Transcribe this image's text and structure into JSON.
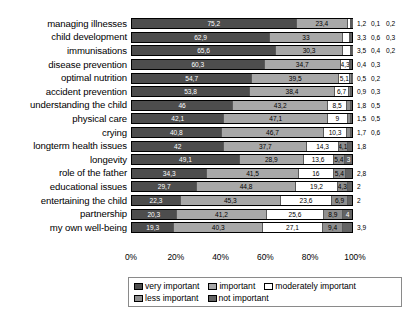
{
  "chart_data": {
    "type": "bar",
    "subtype": "horizontal-stacked-100",
    "title": "",
    "xlabel": "",
    "ylabel": "",
    "xlim": [
      0,
      100
    ],
    "xticks": [
      "0%",
      "20%",
      "40%",
      "60%",
      "80%",
      "100%"
    ],
    "grid": false,
    "legend_position": "bottom",
    "series": [
      {
        "name": "very important",
        "color": "#4d4d4d"
      },
      {
        "name": "important",
        "color": "#a8a8a8"
      },
      {
        "name": "moderately important",
        "color": "#ffffff"
      },
      {
        "name": "less important",
        "color": "#8f8f8f"
      },
      {
        "name": "not important",
        "color": "#636363"
      }
    ],
    "categories": [
      "managing illnesses",
      "child development",
      "immunisations",
      "disease prevention",
      "optimal nutrition",
      "accident prevention",
      "understanding the child",
      "physical care",
      "crying",
      "longterm health issues",
      "longevity",
      "role of the father",
      "educational issues",
      "entertaining the child",
      "partnership",
      "my own well-being"
    ],
    "rows": [
      {
        "category": "managing illnesses",
        "values": [
          75.2,
          23.4,
          1.2,
          0.1,
          0.2
        ],
        "labels": [
          "75,2",
          "23,4",
          "1,2",
          "0,1",
          "0,2"
        ],
        "inside": 2,
        "trailing": [
          "1,2",
          "0,1",
          "0,2"
        ]
      },
      {
        "category": "child development",
        "values": [
          62.9,
          33.0,
          3.3,
          0.6,
          0.3
        ],
        "labels": [
          "62,9",
          "33",
          "3,3",
          "0,6",
          "0,3"
        ],
        "inside": 2,
        "trailing": [
          "3,3",
          "0,6",
          "0,3"
        ]
      },
      {
        "category": "immunisations",
        "values": [
          65.6,
          30.3,
          3.5,
          0.4,
          0.2
        ],
        "labels": [
          "65,6",
          "30,3",
          "3,5",
          "0,4",
          "0,2"
        ],
        "inside": 2,
        "trailing": [
          "3,5",
          "0,4",
          "0,2"
        ]
      },
      {
        "category": "disease prevention",
        "values": [
          60.3,
          34.7,
          4.3,
          0.4,
          0.3
        ],
        "labels": [
          "60,3",
          "34,7",
          "4,3",
          "0,4",
          "0,3"
        ],
        "inside": 3,
        "trailing": [
          "0,4",
          "0,3"
        ]
      },
      {
        "category": "optimal nutrition",
        "values": [
          54.7,
          39.5,
          5.1,
          0.5,
          0.2
        ],
        "labels": [
          "54,7",
          "39,5",
          "5,1",
          "0,5",
          "0,2"
        ],
        "inside": 3,
        "trailing": [
          "0,5",
          "0,2"
        ]
      },
      {
        "category": "accident prevention",
        "values": [
          53.8,
          38.4,
          6.7,
          0.9,
          0.3
        ],
        "labels": [
          "53,8",
          "38,4",
          "6,7",
          "0,9",
          "0,3"
        ],
        "inside": 3,
        "trailing": [
          "0,9",
          "0,3"
        ]
      },
      {
        "category": "understanding the child",
        "values": [
          46.0,
          43.2,
          8.5,
          1.8,
          0.5
        ],
        "labels": [
          "46",
          "43,2",
          "8,5",
          "1,8",
          "0,5"
        ],
        "inside": 3,
        "trailing": [
          "1,8",
          "0,5"
        ]
      },
      {
        "category": "physical care",
        "values": [
          42.1,
          47.1,
          9.0,
          1.5,
          0.5
        ],
        "labels": [
          "42,1",
          "47,1",
          "9",
          "1,5",
          "0,5"
        ],
        "inside": 3,
        "trailing": [
          "1,5",
          "0,5"
        ]
      },
      {
        "category": "crying",
        "values": [
          40.8,
          46.7,
          10.3,
          1.7,
          0.6
        ],
        "labels": [
          "40,8",
          "46,7",
          "10,3",
          "1,7",
          "0,6"
        ],
        "inside": 3,
        "trailing": [
          "1,7",
          "0,6"
        ]
      },
      {
        "category": "longterm health issues",
        "values": [
          42.0,
          37.7,
          14.3,
          4.1,
          1.8
        ],
        "labels": [
          "42",
          "37,7",
          "14,3",
          "4,1",
          "1,8"
        ],
        "inside": 4,
        "trailing": [
          "1,8"
        ]
      },
      {
        "category": "longevity",
        "values": [
          49.1,
          28.9,
          13.6,
          5.4,
          3.0
        ],
        "labels": [
          "49,1",
          "28,9",
          "13,6",
          "5,4",
          "3"
        ],
        "inside": 5,
        "trailing": []
      },
      {
        "category": "role of the father",
        "values": [
          34.3,
          41.5,
          16.0,
          5.4,
          2.8
        ],
        "labels": [
          "34,3",
          "41,5",
          "16",
          "5,4",
          "2,8"
        ],
        "inside": 4,
        "trailing": [
          "2,8"
        ]
      },
      {
        "category": "educational issues",
        "values": [
          29.7,
          44.8,
          19.2,
          4.3,
          2.0
        ],
        "labels": [
          "29,7",
          "44,8",
          "19,2",
          "4,3",
          "2"
        ],
        "inside": 4,
        "trailing": [
          "2"
        ]
      },
      {
        "category": "entertaining the child",
        "values": [
          22.3,
          45.3,
          23.6,
          6.9,
          2.0
        ],
        "labels": [
          "22,3",
          "45,3",
          "23,6",
          "6,9",
          "2"
        ],
        "inside": 4,
        "trailing": [
          "2"
        ]
      },
      {
        "category": "partnership",
        "values": [
          20.3,
          41.2,
          25.6,
          8.9,
          4.0
        ],
        "labels": [
          "20,3",
          "41,2",
          "25,6",
          "8,9",
          "4"
        ],
        "inside": 5,
        "trailing": []
      },
      {
        "category": "my own well-being",
        "values": [
          19.3,
          40.3,
          27.1,
          9.4,
          3.9
        ],
        "labels": [
          "19,3",
          "40,3",
          "27,1",
          "9,4",
          "3,9"
        ],
        "inside": 4,
        "trailing": [
          "3,9"
        ]
      }
    ]
  }
}
